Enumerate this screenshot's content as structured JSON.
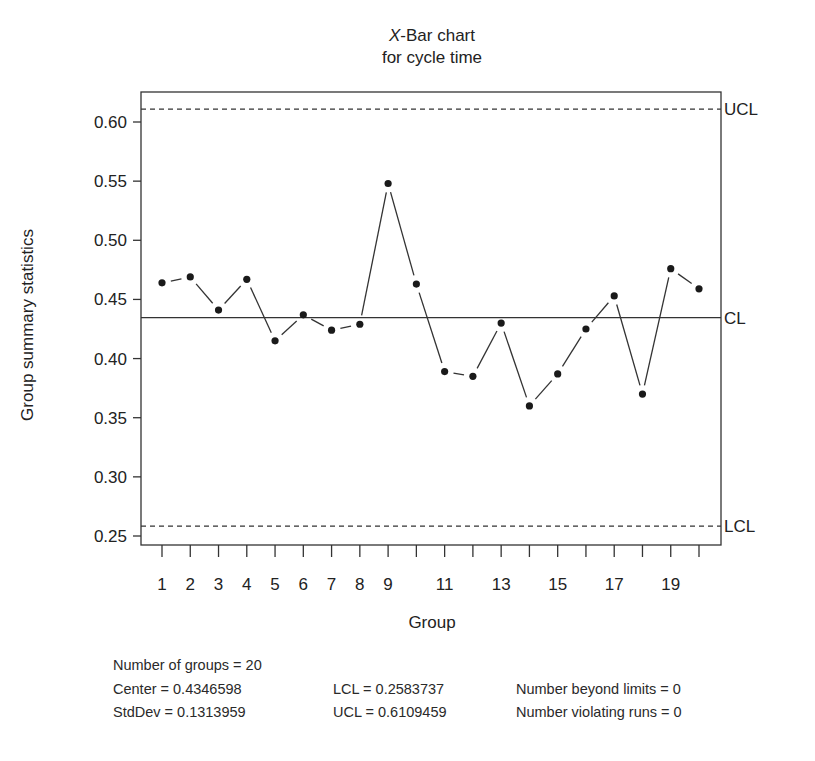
{
  "chart_data": {
    "type": "line",
    "title": "X-Bar chart",
    "title_italic_prefix": "X",
    "title_rest": "-Bar chart",
    "subtitle": "for cycle time",
    "xlabel": "Group",
    "ylabel": "Group summary statistics",
    "ylim": [
      0.25,
      0.625
    ],
    "xlim": [
      0.3,
      20.8
    ],
    "yticks": [
      0.25,
      0.3,
      0.35,
      0.4,
      0.45,
      0.5,
      0.55,
      0.6
    ],
    "ytick_labels": [
      "0.25",
      "0.30",
      "0.35",
      "0.40",
      "0.45",
      "0.50",
      "0.55",
      "0.60"
    ],
    "xticks": [
      1,
      2,
      3,
      4,
      5,
      6,
      7,
      8,
      9,
      10,
      11,
      12,
      13,
      14,
      15,
      16,
      17,
      18,
      19,
      20
    ],
    "xtick_labels": [
      "1",
      "2",
      "3",
      "4",
      "5",
      "6",
      "7",
      "8",
      "9",
      "",
      "11",
      "",
      "13",
      "",
      "15",
      "",
      "17",
      "",
      "19",
      ""
    ],
    "grid": false,
    "x": [
      1,
      2,
      3,
      4,
      5,
      6,
      7,
      8,
      9,
      10,
      11,
      12,
      13,
      14,
      15,
      16,
      17,
      18,
      19,
      20
    ],
    "series": [
      {
        "name": "Group means",
        "values": [
          0.464,
          0.469,
          0.441,
          0.467,
          0.415,
          0.437,
          0.424,
          0.429,
          0.548,
          0.463,
          0.389,
          0.385,
          0.43,
          0.36,
          0.387,
          0.425,
          0.453,
          0.37,
          0.476,
          0.459
        ]
      }
    ],
    "control_lines": [
      {
        "label": "UCL",
        "value": 0.6109459,
        "style": "dashed"
      },
      {
        "label": "CL",
        "value": 0.4346598,
        "style": "solid"
      },
      {
        "label": "LCL",
        "value": 0.2583737,
        "style": "dashed"
      }
    ]
  },
  "stats": {
    "groups": "Number of groups = 20",
    "center": "Center = 0.4346598",
    "stddev": "StdDev = 0.1313959",
    "lcl": "LCL = 0.2583737",
    "ucl": "UCL = 0.6109459",
    "beyond": "Number beyond limits = 0",
    "violating": "Number violating runs = 0"
  }
}
